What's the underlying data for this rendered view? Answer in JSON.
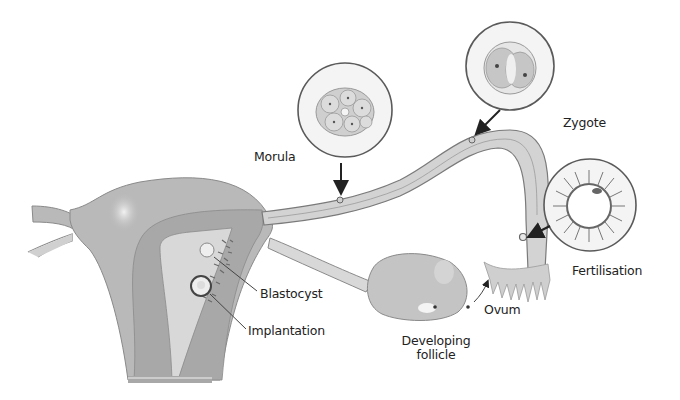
{
  "diagram": {
    "colors": {
      "background": "#ffffff",
      "tissue": "#b9b9b9",
      "tissue_dark": "#a4a4a4",
      "cavity": "#d6d6d6",
      "outline": "#7a7a7a",
      "text": "#222222",
      "arrow": "#222222",
      "inset_fill": "#f4f4f4"
    },
    "labels": {
      "morula": "Morula",
      "zygote": "Zygote",
      "fertilisation": "Fertilisation",
      "blastocyst": "Blastocyst",
      "implantation": "Implantation",
      "ovum": "Ovum",
      "developing_follicle_line1": "Developing",
      "developing_follicle_line2": "follicle"
    },
    "insets": [
      {
        "name": "morula",
        "cx": 345,
        "cy": 110,
        "r": 47
      },
      {
        "name": "zygote",
        "cx": 510,
        "cy": 66,
        "r": 44
      },
      {
        "name": "fertilisation",
        "cx": 590,
        "cy": 205,
        "r": 46
      }
    ]
  }
}
